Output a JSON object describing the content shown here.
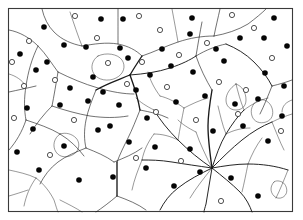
{
  "figure": {
    "background_color": "#ffffff",
    "border_color": "#3a3a3a",
    "line_color": "#1a1a1a",
    "filled_marker_color": "#050505",
    "open_marker_fill": "#ffffff",
    "open_marker_stroke": "#171717",
    "frame": {
      "x": 8,
      "y": 8,
      "width": 285,
      "height": 204
    },
    "counts": {
      "filled_markers": 57,
      "open_markers": 29,
      "network_paths": 62
    }
  },
  "chart_data": {
    "type": "scatter",
    "title": "",
    "xlabel": "",
    "ylabel": "",
    "xlim": [
      8,
      293
    ],
    "ylim": [
      8,
      212
    ],
    "grid": false,
    "legend": "none",
    "series": [
      {
        "name": "filled-markers",
        "marker": "filled-circle",
        "radius": 2.8,
        "color": "#050505",
        "points": [
          [
            101,
            19
          ],
          [
            123,
            19
          ],
          [
            192,
            18
          ],
          [
            274,
            18
          ],
          [
            264,
            38
          ],
          [
            44,
            27
          ],
          [
            64,
            45
          ],
          [
            20,
            54
          ],
          [
            36,
            70
          ],
          [
            86,
            47
          ],
          [
            120,
            48
          ],
          [
            128,
            58
          ],
          [
            162,
            49
          ],
          [
            190,
            34
          ],
          [
            216,
            49
          ],
          [
            240,
            38
          ],
          [
            287,
            46
          ],
          [
            47,
            62
          ],
          [
            70,
            88
          ],
          [
            93,
            77
          ],
          [
            136,
            90
          ],
          [
            103,
            92
          ],
          [
            150,
            75
          ],
          [
            171,
            66
          ],
          [
            193,
            72
          ],
          [
            224,
            61
          ],
          [
            265,
            73
          ],
          [
            284,
            86
          ],
          [
            27,
            108
          ],
          [
            60,
            105
          ],
          [
            88,
            101
          ],
          [
            119,
            105
          ],
          [
            147,
            118
          ],
          [
            110,
            126
          ],
          [
            176,
            102
          ],
          [
            205,
            96
          ],
          [
            235,
            104
          ],
          [
            258,
            99
          ],
          [
            282,
            116
          ],
          [
            33,
            129
          ],
          [
            64,
            146
          ],
          [
            17,
            152
          ],
          [
            98,
            130
          ],
          [
            129,
            142
          ],
          [
            155,
            147
          ],
          [
            190,
            149
          ],
          [
            213,
            131
          ],
          [
            243,
            126
          ],
          [
            268,
            141
          ],
          [
            39,
            170
          ],
          [
            79,
            180
          ],
          [
            113,
            177
          ],
          [
            146,
            168
          ],
          [
            174,
            186
          ],
          [
            200,
            172
          ],
          [
            231,
            178
          ],
          [
            258,
            196
          ]
        ]
      },
      {
        "name": "open-markers",
        "marker": "open-circle",
        "radius": 2.6,
        "color": "#ffffff",
        "points": [
          [
            75,
            16
          ],
          [
            139,
            16
          ],
          [
            232,
            15
          ],
          [
            29,
            41
          ],
          [
            97,
            38
          ],
          [
            160,
            30
          ],
          [
            254,
            28
          ],
          [
            12,
            62
          ],
          [
            108,
            63
          ],
          [
            142,
            62
          ],
          [
            179,
            55
          ],
          [
            207,
            43
          ],
          [
            272,
            58
          ],
          [
            24,
            86
          ],
          [
            55,
            80
          ],
          [
            127,
            84
          ],
          [
            167,
            87
          ],
          [
            219,
            82
          ],
          [
            246,
            90
          ],
          [
            14,
            118
          ],
          [
            74,
            120
          ],
          [
            156,
            112
          ],
          [
            196,
            120
          ],
          [
            238,
            114
          ],
          [
            281,
            131
          ],
          [
            50,
            155
          ],
          [
            136,
            158
          ],
          [
            181,
            161
          ],
          [
            221,
            201
          ]
        ]
      }
    ],
    "network": {
      "description": "Irregular branching curvilinear network resembling drainage channels or cell boundaries, with a dominant radial hub.",
      "hub_points": [
        [
          212,
          168
        ],
        [
          130,
          75
        ],
        [
          196,
          62
        ],
        [
          117,
          196
        ]
      ]
    }
  }
}
